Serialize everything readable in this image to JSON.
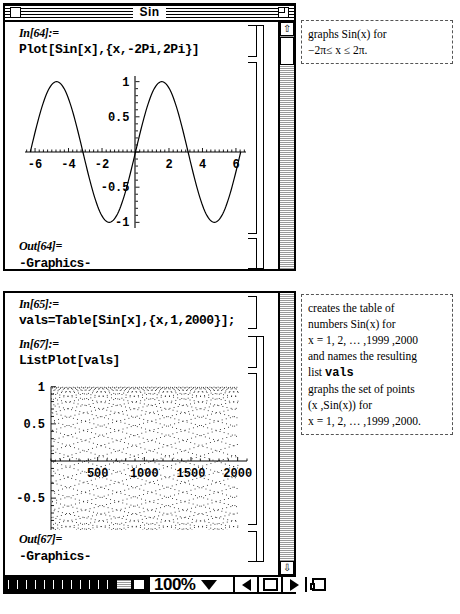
{
  "window1": {
    "title": "Sin",
    "close_icon": "close-box",
    "zoom_icon": "zoom-box",
    "cells": [
      {
        "label": "In[64]:=",
        "code": "Plot[Sin[x],{x,-2Pi,2Pi}]"
      },
      {
        "label": "Out[64]=",
        "code": "-Graphics-"
      }
    ],
    "scroll": {
      "up_arrow": "⇧",
      "thumb": "scroll-thumb"
    }
  },
  "window2": {
    "cells": [
      {
        "label": "In[65]:=",
        "code": "vals=Table[Sin[x],{x,1,2000}];"
      },
      {
        "label": "In[67]:=",
        "code": "ListPlot[vals]"
      },
      {
        "label": "Out[67]=",
        "code": "-Graphics-"
      }
    ],
    "scroll": {
      "down_arrow": "⇩"
    },
    "statusbar": {
      "zoom_level": "100%",
      "dropdown_icon": "chevron-down-icon",
      "prev_icon": "arrow-left-icon",
      "next_icon": "arrow-right-icon",
      "page_icon": "pages-icon"
    }
  },
  "callout1": {
    "lines": [
      "graphs  Sin(x)  for",
      "−2π≤ x ≤ 2π."
    ]
  },
  "callout2": {
    "lines": [
      "creates   the   table   of",
      "numbers   Sin(x)   for",
      "x = 1, 2, … ,1999 ,2000",
      "and   names   the   resulting",
      "list",
      "graphs  the  set  of  points",
      "(x ,Sin(x))  for",
      "x = 1, 2, … ,1999 ,2000."
    ],
    "mono_word": "vals"
  },
  "chart_data": [
    {
      "type": "line",
      "title": "Plot[Sin[x],{x,-2Pi,2Pi}]",
      "xlabel": "",
      "ylabel": "",
      "xlim": [
        -6.6,
        6.6
      ],
      "ylim": [
        -1.08,
        1.08
      ],
      "xticks": [
        -6,
        -4,
        -2,
        2,
        4,
        6
      ],
      "yticks": [
        1,
        0.5,
        -0.5,
        -1
      ],
      "ytick_labels": [
        "1",
        "0.5",
        "-0.5",
        "-1"
      ],
      "xtick_labels": [
        "-6",
        "-4",
        "-2",
        "2",
        "4",
        "6"
      ],
      "grid": false,
      "legend": "none",
      "series": [
        {
          "name": "Sin(x)",
          "function": "sin",
          "x_start": -6.2832,
          "x_end": 6.2832,
          "samples": 200
        }
      ]
    },
    {
      "type": "scatter",
      "title": "ListPlot[vals]",
      "xlabel": "",
      "ylabel": "",
      "xlim": [
        0,
        2100
      ],
      "ylim": [
        -1.05,
        1.05
      ],
      "xticks": [
        500,
        1000,
        1500,
        2000
      ],
      "yticks": [
        1,
        0.5,
        -0.5,
        -1
      ],
      "ytick_labels": [
        "1",
        "0.5",
        "-0.5",
        "-1"
      ],
      "xtick_labels": [
        "500",
        "1000",
        "1500",
        "2000"
      ],
      "grid": false,
      "legend": "none",
      "series": [
        {
          "name": "vals",
          "function": "sin",
          "n_points": 2000,
          "x_start": 1,
          "x_step": 1
        }
      ]
    }
  ],
  "colors": {
    "ink": "#000000",
    "paper": "#ffffff",
    "scroll_track": "#d8d8d8",
    "callout_border": "#555555"
  }
}
